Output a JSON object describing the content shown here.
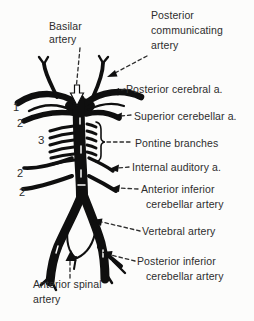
{
  "figure": {
    "type": "anatomical-line-diagram",
    "background_color": "#fcfcfb",
    "ink_color": "#0f0f0f",
    "text_color": "#2d2d2d"
  },
  "labels": {
    "basilar": "Basilar artery",
    "posterior_communicating": "Posterior communicating artery",
    "posterior_cerebral": "Posterior cerebral a.",
    "superior_cerebellar": "Superior cerebellar a.",
    "pontine_branches": "Pontine branches",
    "internal_auditory": "Internal auditory a.",
    "anterior_inferior_cerebellar": "Anterior inferior cerebellar artery",
    "vertebral": "Vertebral artery",
    "posterior_inferior_cerebellar": "Posterior inferior cerebellar artery",
    "anterior_spinal": "Anterior spinal artery"
  },
  "markers": {
    "posterior_cerebral_num": "1",
    "superior_cerebellar_num": "2",
    "pontine_num": "3",
    "internal_auditory_num": "2",
    "aica_num": "2"
  }
}
